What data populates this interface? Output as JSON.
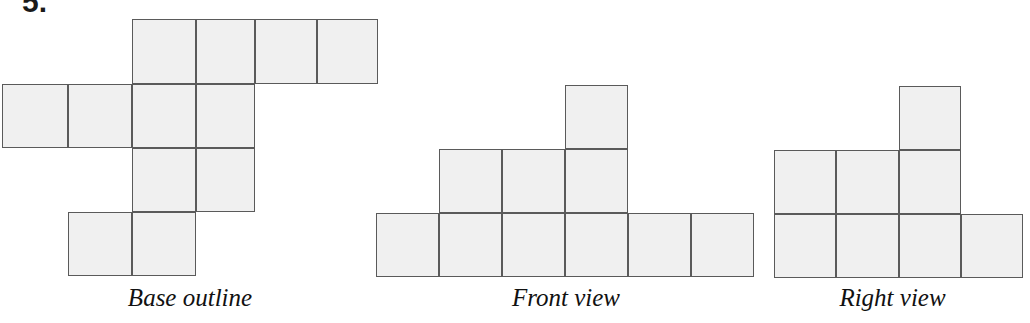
{
  "worksheet": {
    "problem_number": "5.",
    "background_color": "#ffffff",
    "cell_fill_color": "#f0f0f0",
    "cell_stroke_color": "#5a5a5a"
  },
  "figures": [
    {
      "id": "base-outline",
      "label": "Base outline",
      "cell_size": 64,
      "origin": {
        "x": 2,
        "y": 19
      },
      "grid_cols_px": [
        2,
        68,
        132,
        196,
        255,
        317,
        378
      ],
      "grid_rows_px": [
        19,
        84,
        148,
        212,
        276
      ],
      "cells": [
        {
          "col": 2,
          "row": 0
        },
        {
          "col": 3,
          "row": 0
        },
        {
          "col": 4,
          "row": 0
        },
        {
          "col": 5,
          "row": 0
        },
        {
          "col": 0,
          "row": 1
        },
        {
          "col": 1,
          "row": 1
        },
        {
          "col": 2,
          "row": 1
        },
        {
          "col": 3,
          "row": 1
        },
        {
          "col": 2,
          "row": 2
        },
        {
          "col": 3,
          "row": 2
        },
        {
          "col": 1,
          "row": 3
        },
        {
          "col": 2,
          "row": 3
        }
      ],
      "cell_count": 12
    },
    {
      "id": "front-view",
      "label": "Front view",
      "cell_size": 64,
      "origin": {
        "x": 376,
        "y": 85
      },
      "grid_cols_px": [
        376,
        439,
        502,
        565,
        628,
        691,
        754
      ],
      "grid_rows_px": [
        85,
        149,
        213,
        277
      ],
      "cells": [
        {
          "col": 3,
          "row": 0
        },
        {
          "col": 1,
          "row": 1
        },
        {
          "col": 2,
          "row": 1
        },
        {
          "col": 3,
          "row": 1
        },
        {
          "col": 0,
          "row": 2
        },
        {
          "col": 1,
          "row": 2
        },
        {
          "col": 2,
          "row": 2
        },
        {
          "col": 3,
          "row": 2
        },
        {
          "col": 4,
          "row": 2
        },
        {
          "col": 5,
          "row": 2
        }
      ],
      "cell_count": 10,
      "column_heights": [
        1,
        2,
        2,
        3,
        1,
        1
      ]
    },
    {
      "id": "right-view",
      "label": "Right view",
      "cell_size": 63,
      "origin": {
        "x": 774,
        "y": 86
      },
      "grid_cols_px": [
        774,
        836,
        899,
        961,
        1023
      ],
      "grid_rows_px": [
        86,
        150,
        214,
        278
      ],
      "cells": [
        {
          "col": 2,
          "row": 0
        },
        {
          "col": 0,
          "row": 1
        },
        {
          "col": 1,
          "row": 1
        },
        {
          "col": 2,
          "row": 1
        },
        {
          "col": 0,
          "row": 2
        },
        {
          "col": 1,
          "row": 2
        },
        {
          "col": 2,
          "row": 2
        },
        {
          "col": 3,
          "row": 2
        }
      ],
      "cell_count": 8,
      "column_heights": [
        2,
        2,
        3,
        1
      ]
    }
  ]
}
